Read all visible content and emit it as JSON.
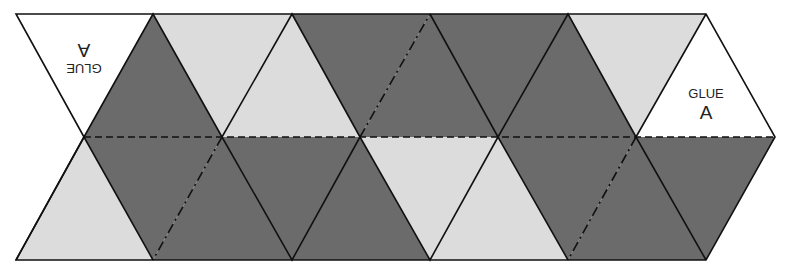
{
  "diagram": {
    "colors": {
      "dark": "#6b6b6b",
      "light": "#dcdcdc",
      "white": "#ffffff",
      "line": "#111111"
    },
    "glue_tabs": [
      {
        "id": "left",
        "text": "GLUE",
        "letter": "A",
        "rotated": true
      },
      {
        "id": "right",
        "text": "GLUE",
        "letter": "A",
        "rotated": false
      }
    ],
    "top_row": [
      "white",
      "dark",
      "light",
      "light",
      "dark",
      "dark",
      "dark",
      "dark",
      "light",
      "white"
    ],
    "bottom_row": [
      "light",
      "dark",
      "dark",
      "dark",
      "dark",
      "light",
      "light",
      "dark",
      "dark",
      "dark"
    ],
    "fold_lines": {
      "midline": "dashed",
      "diagonals": "dash-dot"
    }
  }
}
